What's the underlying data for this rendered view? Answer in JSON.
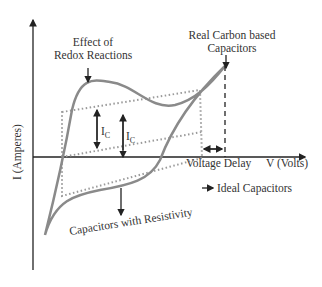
{
  "diagram": {
    "axes": {
      "y_label": "I (Amperes)",
      "x_label": "V (Volts)"
    },
    "annotations": {
      "redox_line1": "Effect of",
      "redox_line2": "Redox Reactions",
      "real_line1": "Real Carbon based",
      "real_line2": "Capacitors",
      "ic_left": "I",
      "ic_left_sub": "C",
      "ic_right": "I",
      "ic_right_sub": "C",
      "voltage_delay": "Voltage Delay",
      "ideal": "Ideal Capacitors",
      "resistivity": "Capacitors with Resistivity"
    },
    "colors": {
      "curve": "#8a8a8a",
      "dotted": "#9a9a9a",
      "axis": "#222222",
      "text": "#333333"
    }
  }
}
